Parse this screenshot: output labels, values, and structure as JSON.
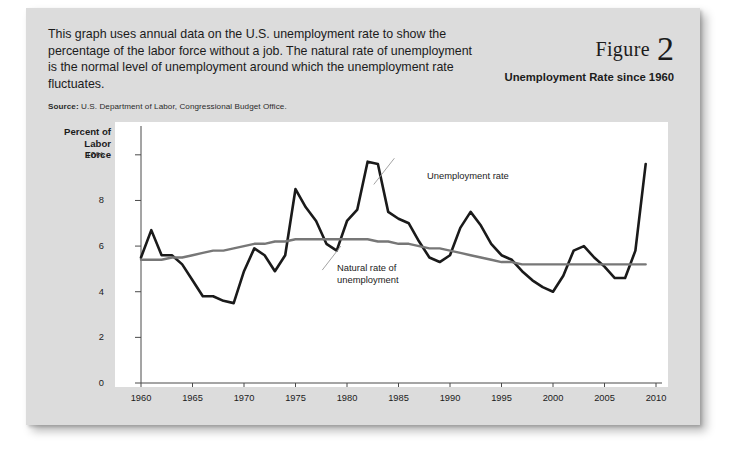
{
  "figure": {
    "word": "Figure",
    "number": "2",
    "subtitle": "Unemployment Rate\nsince 1960",
    "intro": "This graph uses annual data on the U.S. unemployment rate to show the percentage of the labor force without a job. The natural rate of unemployment is the normal level of unemployment around which the unemployment rate fluctuates.",
    "source_label": "Source:",
    "source_text": "U.S. Department of Labor, Congressional Budget Office."
  },
  "chart_data": {
    "type": "line",
    "title": "Unemployment Rate since 1960",
    "xlabel": "",
    "ylabel": "Percent of Labor Force",
    "xlim": [
      1960,
      2010
    ],
    "ylim": [
      0,
      11
    ],
    "grid": false,
    "legend": "annotations",
    "y_ticks": [
      0,
      2,
      4,
      6,
      8,
      10
    ],
    "y_tick_labels": [
      "0",
      "2",
      "4",
      "6",
      "8",
      "10%"
    ],
    "x_ticks": [
      1960,
      1965,
      1970,
      1975,
      1980,
      1985,
      1990,
      1995,
      2000,
      2005,
      2010
    ],
    "x_tick_labels": [
      "1960",
      "1965",
      "1970",
      "1975",
      "1980",
      "1985",
      "1990",
      "1995",
      "2000",
      "2005",
      "2010"
    ],
    "x": [
      1960,
      1961,
      1962,
      1963,
      1964,
      1965,
      1966,
      1967,
      1968,
      1969,
      1970,
      1971,
      1972,
      1973,
      1974,
      1975,
      1976,
      1977,
      1978,
      1979,
      1980,
      1981,
      1982,
      1983,
      1984,
      1985,
      1986,
      1987,
      1988,
      1989,
      1990,
      1991,
      1992,
      1993,
      1994,
      1995,
      1996,
      1997,
      1998,
      1999,
      2000,
      2001,
      2002,
      2003,
      2004,
      2005,
      2006,
      2007,
      2008,
      2009
    ],
    "series": [
      {
        "name": "Unemployment rate",
        "color": "#1a1a1a",
        "width": 2.6,
        "values": [
          5.5,
          6.7,
          5.6,
          5.6,
          5.2,
          4.5,
          3.8,
          3.8,
          3.6,
          3.5,
          4.9,
          5.9,
          5.6,
          4.9,
          5.6,
          8.5,
          7.7,
          7.1,
          6.1,
          5.8,
          7.1,
          7.6,
          9.7,
          9.6,
          7.5,
          7.2,
          7.0,
          6.2,
          5.5,
          5.3,
          5.6,
          6.8,
          7.5,
          6.9,
          6.1,
          5.6,
          5.4,
          4.9,
          4.5,
          4.2,
          4.0,
          4.7,
          5.8,
          6.0,
          5.5,
          5.1,
          4.6,
          4.6,
          5.8,
          9.6
        ]
      },
      {
        "name": "Natural rate of unemployment",
        "color": "#777777",
        "width": 2.4,
        "values": [
          5.4,
          5.4,
          5.4,
          5.5,
          5.5,
          5.6,
          5.7,
          5.8,
          5.8,
          5.9,
          6.0,
          6.1,
          6.1,
          6.2,
          6.2,
          6.3,
          6.3,
          6.3,
          6.3,
          6.3,
          6.3,
          6.3,
          6.3,
          6.2,
          6.2,
          6.1,
          6.1,
          6.0,
          5.9,
          5.9,
          5.8,
          5.7,
          5.6,
          5.5,
          5.4,
          5.3,
          5.3,
          5.2,
          5.2,
          5.2,
          5.2,
          5.2,
          5.2,
          5.2,
          5.2,
          5.2,
          5.2,
          5.2,
          5.2,
          5.2
        ]
      }
    ],
    "annotations": [
      {
        "text": "Unemployment rate",
        "x": 1985.0,
        "y": 10.0
      },
      {
        "text": "Natural rate of\nunemployment",
        "x": 1978.0,
        "y": 4.6
      }
    ]
  }
}
